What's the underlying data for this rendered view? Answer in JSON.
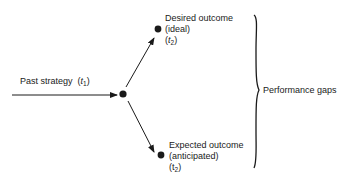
{
  "diagram": {
    "type": "strategy-outcome-gap",
    "input": {
      "label": "Past strategy",
      "time_var": "t",
      "time_sub": "1"
    },
    "top_node": {
      "line1": "Desired outcome",
      "line2": "(ideal)",
      "time_var": "t",
      "time_sub": "2"
    },
    "bottom_node": {
      "line1": "Expected outcome",
      "line2": "(anticipated)",
      "time_var": "t",
      "time_sub": "2"
    },
    "brace_label": "Performance gaps",
    "colors": {
      "ink": "#1a1a1a",
      "background": "#ffffff"
    }
  }
}
